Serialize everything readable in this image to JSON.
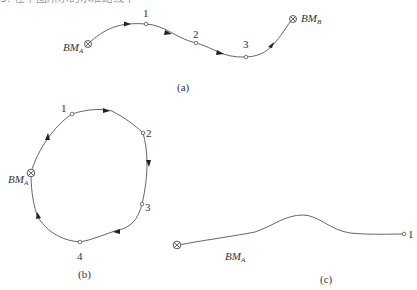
{
  "header": {
    "cut_off_text": "3. 在下图所示的水准路线中"
  },
  "diagrams": [
    {
      "id": "a",
      "caption": "(a)",
      "route_type": "attached leveling line",
      "start": {
        "label": "BM",
        "subscript": "A"
      },
      "end": {
        "label": "BM",
        "subscript": "B"
      },
      "points": [
        "1",
        "2",
        "3"
      ]
    },
    {
      "id": "b",
      "caption": "(b)",
      "route_type": "closed leveling loop",
      "start": {
        "label": "BM",
        "subscript": "A"
      },
      "points": [
        "1",
        "2",
        "3",
        "4"
      ]
    },
    {
      "id": "c",
      "caption": "(c)",
      "route_type": "spur leveling line",
      "start": {
        "label": "BM",
        "subscript": "A"
      },
      "points": [
        "1"
      ]
    }
  ],
  "colors": {
    "line": "#555555",
    "text": "#333333",
    "background": "#ffffff"
  }
}
